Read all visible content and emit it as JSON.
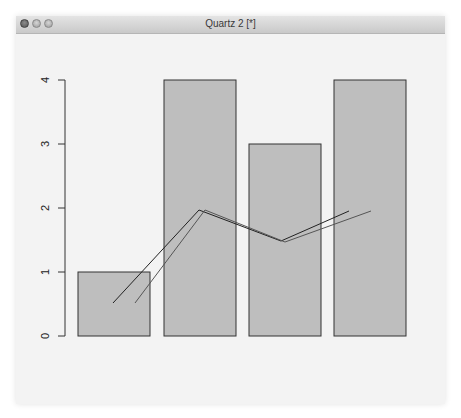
{
  "window": {
    "title": "Quartz 2 [*]",
    "buttons": [
      "close",
      "minimize",
      "zoom"
    ]
  },
  "colors": {
    "bar_fill": "#bebebe",
    "bar_border": "#333333",
    "line1": "#222222",
    "line2": "#555555",
    "plot_background": "#f3f3f3"
  },
  "chart_data": {
    "type": "bar",
    "title": "",
    "xlabel": "",
    "ylabel": "",
    "categories": [
      "1",
      "2",
      "3",
      "4"
    ],
    "values": [
      1,
      4,
      3,
      4
    ],
    "ylim": [
      0,
      4
    ],
    "yticks": [
      "0",
      "1",
      "2",
      "3",
      "4"
    ],
    "grid": false,
    "legend": null,
    "overlay_lines": [
      {
        "name": "line1",
        "type": "line",
        "x": [
          0.7,
          1.9,
          3.1,
          4.3
        ],
        "y": [
          0.5,
          1.95,
          1.47,
          1.95
        ]
      },
      {
        "name": "line2",
        "type": "line",
        "x": [
          1.0,
          2.0,
          3.1,
          4.3
        ],
        "y": [
          0.5,
          1.95,
          1.45,
          1.95
        ]
      }
    ]
  }
}
